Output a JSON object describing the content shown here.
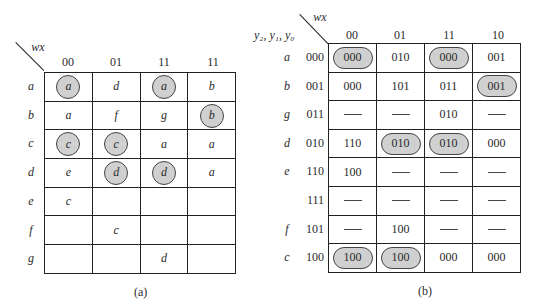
{
  "figure_a": {
    "corner_label": "wx",
    "columns": [
      "00",
      "01",
      "11",
      "11"
    ],
    "rows": [
      {
        "label": "a",
        "cells": [
          {
            "v": "a",
            "hl": true
          },
          {
            "v": "d",
            "hl": false
          },
          {
            "v": "a",
            "hl": true
          },
          {
            "v": "b",
            "hl": false
          }
        ]
      },
      {
        "label": "b",
        "cells": [
          {
            "v": "a",
            "hl": false
          },
          {
            "v": "f",
            "hl": false
          },
          {
            "v": "g",
            "hl": false
          },
          {
            "v": "b",
            "hl": true
          }
        ]
      },
      {
        "label": "c",
        "cells": [
          {
            "v": "c",
            "hl": true
          },
          {
            "v": "c",
            "hl": true
          },
          {
            "v": "a",
            "hl": false
          },
          {
            "v": "a",
            "hl": false
          }
        ]
      },
      {
        "label": "d",
        "cells": [
          {
            "v": "e",
            "hl": false
          },
          {
            "v": "d",
            "hl": true
          },
          {
            "v": "d",
            "hl": true
          },
          {
            "v": "a",
            "hl": false
          }
        ]
      },
      {
        "label": "e",
        "cells": [
          {
            "v": "c",
            "hl": false
          },
          {
            "v": "",
            "hl": false
          },
          {
            "v": "",
            "hl": false
          },
          {
            "v": "",
            "hl": false
          }
        ]
      },
      {
        "label": "f",
        "cells": [
          {
            "v": "",
            "hl": false
          },
          {
            "v": "c",
            "hl": false
          },
          {
            "v": "",
            "hl": false
          },
          {
            "v": "",
            "hl": false
          }
        ]
      },
      {
        "label": "g",
        "cells": [
          {
            "v": "",
            "hl": false
          },
          {
            "v": "",
            "hl": false
          },
          {
            "v": "d",
            "hl": false
          },
          {
            "v": "",
            "hl": false
          }
        ]
      }
    ],
    "caption": "(a)"
  },
  "figure_b": {
    "corner_label": "wx",
    "row_header": "y₂, y₁, y₀",
    "columns": [
      "00",
      "01",
      "11",
      "10"
    ],
    "rows": [
      {
        "label": "a",
        "code": "000",
        "cells": [
          {
            "v": "000",
            "hl": true
          },
          {
            "v": "010",
            "hl": false
          },
          {
            "v": "000",
            "hl": true
          },
          {
            "v": "001",
            "hl": false
          }
        ]
      },
      {
        "label": "b",
        "code": "001",
        "cells": [
          {
            "v": "000",
            "hl": false
          },
          {
            "v": "101",
            "hl": false
          },
          {
            "v": "011",
            "hl": false
          },
          {
            "v": "001",
            "hl": true
          }
        ]
      },
      {
        "label": "g",
        "code": "011",
        "cells": [
          {
            "v": "—",
            "hl": false
          },
          {
            "v": "—",
            "hl": false
          },
          {
            "v": "010",
            "hl": false
          },
          {
            "v": "—",
            "hl": false
          }
        ]
      },
      {
        "label": "d",
        "code": "010",
        "cells": [
          {
            "v": "110",
            "hl": false
          },
          {
            "v": "010",
            "hl": true
          },
          {
            "v": "010",
            "hl": true
          },
          {
            "v": "000",
            "hl": false
          }
        ]
      },
      {
        "label": "e",
        "code": "110",
        "cells": [
          {
            "v": "100",
            "hl": false
          },
          {
            "v": "—",
            "hl": false
          },
          {
            "v": "—",
            "hl": false
          },
          {
            "v": "—",
            "hl": false
          }
        ]
      },
      {
        "label": "",
        "code": "111",
        "cells": [
          {
            "v": "—",
            "hl": false
          },
          {
            "v": "—",
            "hl": false
          },
          {
            "v": "—",
            "hl": false
          },
          {
            "v": "—",
            "hl": false
          }
        ]
      },
      {
        "label": "f",
        "code": "101",
        "cells": [
          {
            "v": "—",
            "hl": false
          },
          {
            "v": "100",
            "hl": false
          },
          {
            "v": "—",
            "hl": false
          },
          {
            "v": "—",
            "hl": false
          }
        ]
      },
      {
        "label": "c",
        "code": "100",
        "cells": [
          {
            "v": "100",
            "hl": true
          },
          {
            "v": "100",
            "hl": true
          },
          {
            "v": "000",
            "hl": false
          },
          {
            "v": "000",
            "hl": false
          }
        ]
      }
    ],
    "caption": "(b)"
  },
  "colors": {
    "highlight_fill": "#d0d0d0",
    "grid_line": "#222222"
  }
}
